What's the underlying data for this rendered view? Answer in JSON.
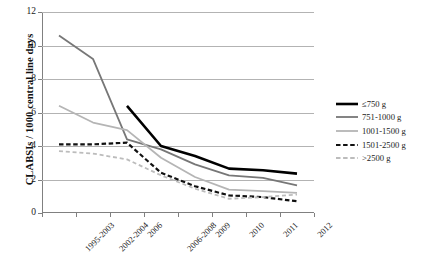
{
  "chart_data": {
    "type": "line",
    "title": "",
    "xlabel": "",
    "ylabel": "CLABSIs / 1000 central line days",
    "ylim": [
      0,
      12
    ],
    "yticks": [
      0,
      2,
      4,
      6,
      8,
      10,
      12
    ],
    "grid": true,
    "legend_position": "right",
    "categories": [
      "1995-2003",
      "2002-2004",
      "2006",
      "2006-2008",
      "2009",
      "2010",
      "2011",
      "2012"
    ],
    "series": [
      {
        "name": "≤750 g",
        "color": "#000000",
        "style": "solid",
        "width": 2.6,
        "values": [
          null,
          null,
          6.4,
          4.0,
          3.4,
          2.65,
          2.55,
          2.35
        ]
      },
      {
        "name": "751-1000 g",
        "color": "#777777",
        "style": "solid",
        "width": 1.8,
        "values": [
          10.6,
          9.2,
          4.4,
          3.8,
          2.9,
          2.25,
          2.1,
          1.65
        ]
      },
      {
        "name": "1001-1500 g",
        "color": "#b5b5b5",
        "style": "solid",
        "width": 1.8,
        "values": [
          6.4,
          5.4,
          4.95,
          3.3,
          2.15,
          1.4,
          1.3,
          1.2
        ]
      },
      {
        "name": "1501-2500 g",
        "color": "#111111",
        "style": "dashed",
        "width": 2.2,
        "values": [
          4.1,
          4.1,
          4.2,
          2.4,
          1.6,
          1.05,
          0.95,
          0.7
        ]
      },
      {
        "name": ">2500 g",
        "color": "#bcbcbc",
        "style": "dashed",
        "width": 1.8,
        "values": [
          3.7,
          3.55,
          3.2,
          2.25,
          1.45,
          0.85,
          0.95,
          1.1
        ]
      }
    ]
  }
}
